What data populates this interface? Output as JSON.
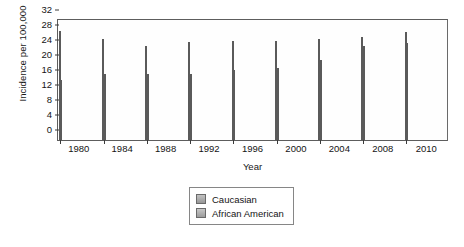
{
  "chart_data": {
    "type": "bar",
    "title": "",
    "xlabel": "Year",
    "ylabel": "Incidence per 100,000",
    "categories": [
      "1980",
      "1984",
      "1988",
      "1992",
      "1996",
      "2000",
      "2004",
      "2008",
      "2010"
    ],
    "series": [
      {
        "name": "Caucasian",
        "values": [
          29.0,
          27.0,
          25.2,
          26.2,
          26.3,
          26.4,
          26.9,
          27.4,
          28.9
        ]
      },
      {
        "name": "African American",
        "values": [
          15.9,
          17.5,
          17.7,
          17.7,
          18.8,
          19.3,
          21.3,
          25.0,
          25.9
        ]
      }
    ],
    "ylim": [
      0,
      32
    ],
    "yticks": [
      "0",
      "4",
      "8",
      "12",
      "16",
      "20",
      "24",
      "28",
      "32"
    ],
    "ytick_values": [
      0,
      4,
      8,
      12,
      16,
      20,
      24,
      28,
      32
    ],
    "grid": false,
    "legend_position": "bottom-center"
  },
  "legend": {
    "items": [
      {
        "label": "Caucasian"
      },
      {
        "label": "African American"
      }
    ]
  }
}
